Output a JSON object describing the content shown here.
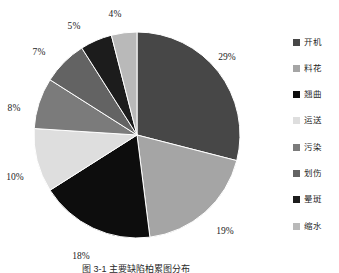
{
  "chart_data": {
    "type": "pie",
    "title": "",
    "categories": [
      "开机",
      "料花",
      "翘曲",
      "运送",
      "污染",
      "划伤",
      "晕斑",
      "缩水"
    ],
    "values": [
      29,
      19,
      18,
      10,
      8,
      7,
      5,
      4
    ],
    "value_unit": "%",
    "data_labels": [
      "29%",
      "19%",
      "18%",
      "10%",
      "8%",
      "7%",
      "5%",
      "4%"
    ],
    "colors": [
      "#474747",
      "#a5a5a5",
      "#0d0d0d",
      "#dedede",
      "#7b7b7b",
      "#636363",
      "#1c1c1c",
      "#b9b9b9"
    ],
    "start_angle_deg": 0,
    "direction": "clockwise",
    "legend_position": "right",
    "grid": false,
    "xlabel": "",
    "ylabel": ""
  },
  "slices": [
    {
      "label": "开机",
      "percent_text": "29%",
      "value": 29,
      "color": "#474747",
      "label_x": 227,
      "label_y": 57
    },
    {
      "label": "料花",
      "percent_text": "19%",
      "value": 19,
      "color": "#a5a5a5",
      "label_x": 225,
      "label_y": 231
    },
    {
      "label": "翘曲",
      "percent_text": "18%",
      "value": 18,
      "color": "#0d0d0d",
      "label_x": 81,
      "label_y": 256
    },
    {
      "label": "运送",
      "percent_text": "10%",
      "value": 10,
      "color": "#dedede",
      "label_x": 15,
      "label_y": 177
    },
    {
      "label": "污染",
      "percent_text": "8%",
      "value": 8,
      "color": "#7b7b7b",
      "label_x": 14,
      "label_y": 108
    },
    {
      "label": "划伤",
      "percent_text": "7%",
      "value": 7,
      "color": "#636363",
      "label_x": 39,
      "label_y": 52
    },
    {
      "label": "晕斑",
      "percent_text": "5%",
      "value": 5,
      "color": "#1c1c1c",
      "label_x": 74,
      "label_y": 26
    },
    {
      "label": "缩水",
      "percent_text": "4%",
      "value": 4,
      "color": "#b9b9b9",
      "label_x": 115,
      "label_y": 14
    }
  ],
  "legend": {
    "items": [
      {
        "label": "开机",
        "color": "#474747"
      },
      {
        "label": "料花",
        "color": "#a5a5a5"
      },
      {
        "label": "翘曲",
        "color": "#0d0d0d"
      },
      {
        "label": "运送",
        "color": "#dedede"
      },
      {
        "label": "污染",
        "color": "#7b7b7b"
      },
      {
        "label": "划伤",
        "color": "#636363"
      },
      {
        "label": "晕斑",
        "color": "#1c1c1c"
      },
      {
        "label": "缩水",
        "color": "#b9b9b9"
      }
    ]
  },
  "caption": {
    "text": "图 3-1  主要缺陷柏累图分布"
  },
  "geometry": {
    "cx": 137,
    "cy": 135,
    "r": 103
  }
}
